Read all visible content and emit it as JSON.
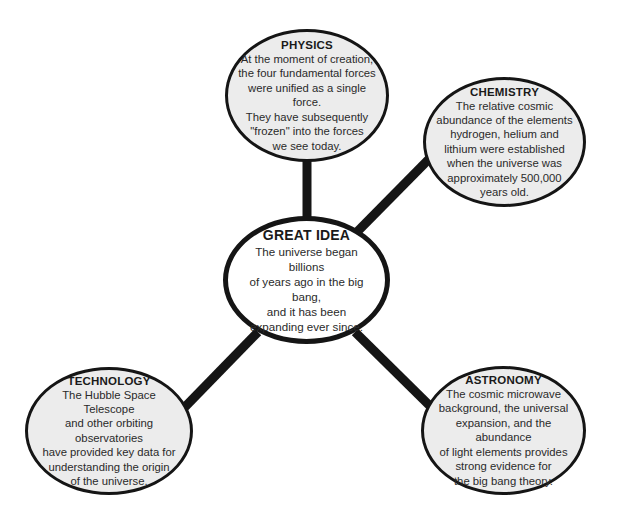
{
  "diagram": {
    "type": "concept-web",
    "colors": {
      "outline": "#151515",
      "outer_fill": "#ececec",
      "center_fill": "#ffffff",
      "text": "#2a2a2a"
    },
    "center": {
      "title": "GREAT IDEA",
      "body": "The universe began billions\nof years ago in the big bang,\nand it has been\nexpanding ever since."
    },
    "nodes": {
      "physics": {
        "title": "PHYSICS",
        "body": "At the moment of creation,\nthe four fundamental forces\nwere unified as a single force.\nThey have subsequently\n\"frozen\" into the forces\nwe see today."
      },
      "chemistry": {
        "title": "CHEMISTRY",
        "body": "The relative cosmic\nabundance of the elements\nhydrogen, helium and\nlithium were established\nwhen the universe was\napproximately 500,000\nyears old."
      },
      "technology": {
        "title": "TECHNOLOGY",
        "body": "The Hubble Space Telescope\nand other orbiting observatories\nhave provided key data for\nunderstanding the origin\nof the universe."
      },
      "astronomy": {
        "title": "ASTRONOMY",
        "body": "The cosmic microwave\nbackground, the universal\nexpansion, and the abundance\nof light elements provides\nstrong evidence for\nthe big bang theory."
      }
    }
  }
}
